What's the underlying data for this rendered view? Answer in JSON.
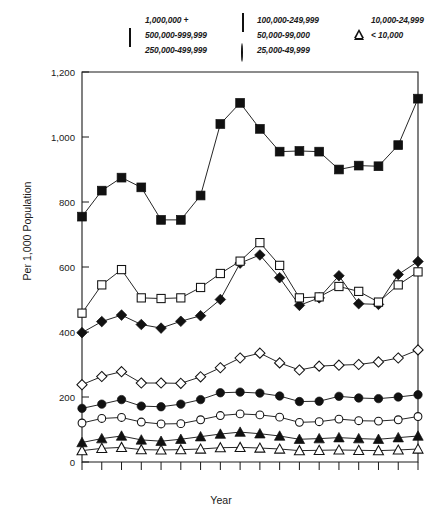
{
  "legend": {
    "entries": [
      {
        "label": "1,000,000 +",
        "marker": "square-filled",
        "icon": "filled-square-icon"
      },
      {
        "label": "100,000-249,999",
        "marker": "diamond-open",
        "icon": "open-diamond-icon"
      },
      {
        "label": "10,000-24,999",
        "marker": "triangle-filled",
        "icon": "filled-triangle-icon"
      },
      {
        "label": "500,000-999,999",
        "marker": "square-open",
        "icon": "open-square-icon"
      },
      {
        "label": "50,000-99,000",
        "marker": "circle-filled",
        "icon": "filled-circle-icon"
      },
      {
        "label": "< 10,000",
        "marker": "triangle-open",
        "icon": "open-triangle-icon"
      },
      {
        "label": "250,000-499,999",
        "marker": "diamond-filled",
        "icon": "filled-diamond-icon"
      },
      {
        "label": "25,000-49,999",
        "marker": "circle-open",
        "icon": "open-circle-icon"
      }
    ]
  },
  "axes": {
    "ylabel": "Per 1,000 Population",
    "xlabel": "Year",
    "ytick_labels": [
      "0",
      "200",
      "400",
      "600",
      "800",
      "1,000",
      "1,200"
    ],
    "xtick_labels": [
      "1973",
      "1976",
      "1979",
      "1982",
      "1985",
      "1988"
    ]
  },
  "caption": "",
  "chart_data": {
    "type": "line",
    "title": "",
    "xlabel": "Year",
    "ylabel": "Per 1,000 Population",
    "xlim": [
      1973,
      1990
    ],
    "ylim": [
      0,
      1200
    ],
    "ytick_values": [
      0,
      200,
      400,
      600,
      800,
      1000,
      1200
    ],
    "xtick_values": [
      1973,
      1976,
      1979,
      1982,
      1985,
      1988
    ],
    "xtick_labeled_every": 3,
    "grid": false,
    "legend_position": "above-plot",
    "x": [
      1973,
      1974,
      1975,
      1976,
      1977,
      1978,
      1979,
      1980,
      1981,
      1982,
      1983,
      1984,
      1985,
      1986,
      1987,
      1988,
      1989,
      1990
    ],
    "series": [
      {
        "name": "1,000,000 +",
        "marker": "square-filled",
        "values": [
          755,
          835,
          875,
          845,
          745,
          745,
          820,
          1040,
          1105,
          1025,
          955,
          957,
          955,
          900,
          912,
          910,
          975,
          1118
        ]
      },
      {
        "name": "500,000-999,999",
        "marker": "square-open",
        "values": [
          458,
          545,
          592,
          505,
          503,
          505,
          537,
          580,
          618,
          675,
          605,
          505,
          508,
          540,
          525,
          492,
          545,
          585
        ]
      },
      {
        "name": "250,000-499,999",
        "marker": "diamond-filled",
        "values": [
          398,
          432,
          452,
          423,
          412,
          433,
          450,
          500,
          612,
          637,
          567,
          482,
          505,
          573,
          487,
          485,
          577,
          617
        ]
      },
      {
        "name": "100,000-249,999",
        "marker": "diamond-open",
        "values": [
          238,
          263,
          278,
          243,
          243,
          242,
          262,
          290,
          320,
          335,
          305,
          283,
          295,
          298,
          300,
          308,
          320,
          345
        ]
      },
      {
        "name": "50,000-99,000",
        "marker": "circle-filled",
        "values": [
          165,
          178,
          192,
          172,
          170,
          178,
          192,
          213,
          215,
          212,
          203,
          186,
          187,
          202,
          197,
          195,
          200,
          207
        ]
      },
      {
        "name": "25,000-49,999",
        "marker": "circle-open",
        "values": [
          120,
          134,
          137,
          123,
          117,
          118,
          130,
          143,
          148,
          145,
          138,
          122,
          124,
          132,
          127,
          126,
          130,
          140
        ]
      },
      {
        "name": "10,000-24,999",
        "marker": "triangle-filled",
        "values": [
          60,
          72,
          80,
          68,
          64,
          70,
          78,
          86,
          92,
          87,
          80,
          70,
          72,
          75,
          72,
          70,
          75,
          80
        ]
      },
      {
        "name": "< 10,000",
        "marker": "triangle-open",
        "values": [
          35,
          42,
          45,
          38,
          37,
          38,
          40,
          44,
          45,
          43,
          40,
          35,
          36,
          37,
          36,
          35,
          37,
          40
        ]
      }
    ]
  }
}
